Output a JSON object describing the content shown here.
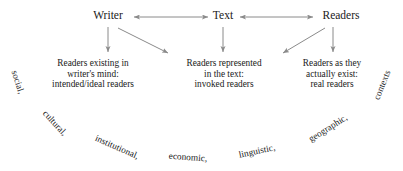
{
  "diagram": {
    "colors": {
      "arrow": "#8a8a8a",
      "text": "#1a1a1a",
      "background": "#ffffff"
    },
    "nodes": [
      {
        "id": "writer",
        "label": "Writer",
        "x": 108,
        "y": 10
      },
      {
        "id": "text",
        "label": "Text",
        "x": 223,
        "y": 10
      },
      {
        "id": "readers",
        "label": "Readers",
        "x": 341,
        "y": 10
      }
    ],
    "descriptions": [
      {
        "id": "intended-ideal-readers",
        "line1": "Readers existing in",
        "line2": "writer's mind:",
        "line3": "intended/ideal readers",
        "x": 93,
        "y": 58
      },
      {
        "id": "invoked-readers",
        "line1": "Readers represented",
        "line2": "in the text:",
        "line3": "invoked readers",
        "x": 224,
        "y": 58
      },
      {
        "id": "real-readers",
        "line1": "Readers as they",
        "line2": "actually exist:",
        "line3": "real readers",
        "x": 332,
        "y": 58
      }
    ],
    "context_words": [
      {
        "id": "social",
        "label": "social,",
        "x": 18,
        "y": 82,
        "rotation": -72
      },
      {
        "id": "cultural",
        "label": "cultural,",
        "x": 55,
        "y": 123,
        "rotation": -47
      },
      {
        "id": "institutional",
        "label": "institutional,",
        "x": 117,
        "y": 147,
        "rotation": -24
      },
      {
        "id": "economic",
        "label": "economic,",
        "x": 188,
        "y": 157,
        "rotation": -4
      },
      {
        "id": "linguistic",
        "label": "linguistic,",
        "x": 257,
        "y": 151,
        "rotation": 12
      },
      {
        "id": "geographic",
        "label": "geographic,",
        "x": 328,
        "y": 128,
        "rotation": 32
      },
      {
        "id": "contexts",
        "label": "contexts",
        "x": 382,
        "y": 85,
        "rotation": 68
      }
    ],
    "connections": [
      {
        "id": "writer-text",
        "from": "writer",
        "to": "text",
        "type": "double-arrow"
      },
      {
        "id": "text-readers",
        "from": "text",
        "to": "readers",
        "type": "double-arrow"
      },
      {
        "id": "writer-down",
        "from": "writer",
        "to": "intended-ideal-readers",
        "type": "arrow"
      },
      {
        "id": "writer-diagonal",
        "from": "writer",
        "to": "invoked-readers",
        "type": "arrow"
      },
      {
        "id": "text-down",
        "from": "text",
        "to": "invoked-readers",
        "type": "arrow"
      },
      {
        "id": "readers-down",
        "from": "readers",
        "to": "real-readers",
        "type": "arrow"
      },
      {
        "id": "readers-diagonal",
        "from": "readers",
        "to": "invoked-readers",
        "type": "arrow"
      }
    ]
  }
}
